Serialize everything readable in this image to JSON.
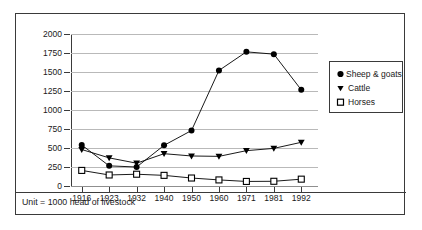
{
  "caption": "Unit = 1000 head of livestock",
  "legend": {
    "items": [
      {
        "label": "Sheep & goats",
        "marker": "filled-circle-icon",
        "color": "#000000"
      },
      {
        "label": "Cattle",
        "marker": "filled-triangle-down-icon",
        "color": "#000000"
      },
      {
        "label": "Horses",
        "marker": "open-square-icon",
        "color": "#000000"
      }
    ]
  },
  "chart_data": {
    "type": "line",
    "title": "",
    "xlabel": "",
    "ylabel": "",
    "categories": [
      "1916",
      "1923",
      "1932",
      "1940",
      "1950",
      "1960",
      "1971",
      "1981",
      "1992"
    ],
    "yticks": [
      0,
      250,
      500,
      750,
      1000,
      1250,
      1500,
      1750,
      2000
    ],
    "ylim": [
      0,
      2000
    ],
    "grid": true,
    "legend_position": "right",
    "series": [
      {
        "name": "Sheep & goats",
        "marker": "filled-circle",
        "values": [
          540,
          265,
          250,
          535,
          730,
          1520,
          1765,
          1735,
          1265
        ]
      },
      {
        "name": "Cattle",
        "marker": "filled-triangle-down",
        "values": [
          480,
          370,
          300,
          425,
          395,
          390,
          465,
          495,
          575
        ]
      },
      {
        "name": "Horses",
        "marker": "open-square",
        "values": [
          205,
          145,
          155,
          140,
          105,
          80,
          60,
          62,
          90
        ]
      }
    ]
  }
}
